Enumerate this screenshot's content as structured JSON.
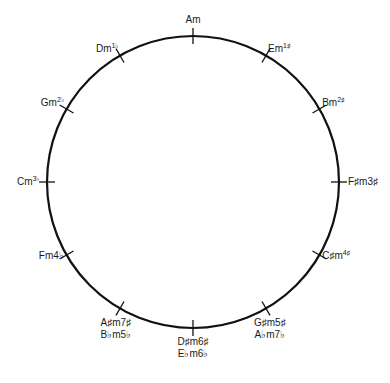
{
  "diagram": {
    "circle": {
      "cx": 193,
      "cy": 182,
      "r": 146,
      "stroke": "#111111",
      "stroke_width": 2.2
    },
    "keys": [
      {
        "key": "Am",
        "sig": "",
        "alt_key": "",
        "alt_sig": "",
        "angle": 0
      },
      {
        "key": "Em",
        "sig": "1♯",
        "alt_key": "",
        "alt_sig": "",
        "angle": 30
      },
      {
        "key": "Bm",
        "sig": "2♯",
        "alt_key": "",
        "alt_sig": "",
        "angle": 60
      },
      {
        "key": "F♯m",
        "sig": "3♯",
        "alt_key": "",
        "alt_sig": "",
        "angle": 90
      },
      {
        "key": "C♯m",
        "sig": "4♯",
        "alt_key": "",
        "alt_sig": "",
        "angle": 120
      },
      {
        "key": "G♯m",
        "sig": "5♯",
        "alt_key": "A♭m",
        "alt_sig": "7♭",
        "angle": 150
      },
      {
        "key": "D♯m",
        "sig": "6♯",
        "alt_key": "E♭m",
        "alt_sig": "6♭",
        "angle": 180
      },
      {
        "key": "A♯m",
        "sig": "7♯",
        "alt_key": "B♭m",
        "alt_sig": "5♭",
        "angle": 210
      },
      {
        "key": "Fm",
        "sig": "4♭",
        "alt_key": "",
        "alt_sig": "",
        "angle": 240
      },
      {
        "key": "Cm",
        "sig": "3♭",
        "alt_key": "",
        "alt_sig": "",
        "angle": 270
      },
      {
        "key": "Gm",
        "sig": "2♭",
        "alt_key": "",
        "alt_sig": "",
        "angle": 300
      },
      {
        "key": "Dm",
        "sig": "1♭",
        "alt_key": "",
        "alt_sig": "",
        "angle": 330
      }
    ]
  }
}
